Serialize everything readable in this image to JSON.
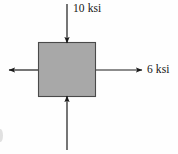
{
  "figure": {
    "kind": "stress-element-diagram",
    "background_color": "#fefefe",
    "element": {
      "name": "stress-element-square",
      "shape": "square",
      "fill_color": "#a8a8a8",
      "stroke_color": "#4a4a4a",
      "x": 38,
      "y": 42,
      "width": 58,
      "height": 55
    },
    "labels": {
      "top": "10 ksi",
      "right": "6 ksi"
    },
    "arrows": [
      {
        "name": "top-compression-arrow",
        "label": "10 ksi",
        "direction": "down",
        "sense": "compression",
        "x1": 67,
        "y1": 4,
        "x2": 67,
        "y2": 43,
        "color": "#1a1a1a"
      },
      {
        "name": "bottom-compression-arrow",
        "label": "10 ksi",
        "direction": "up",
        "sense": "compression",
        "x1": 67,
        "y1": 150,
        "x2": 67,
        "y2": 96,
        "color": "#1a1a1a"
      },
      {
        "name": "right-tension-arrow",
        "label": "6 ksi",
        "direction": "right",
        "sense": "tension",
        "x1": 96,
        "y1": 70,
        "x2": 142,
        "y2": 70,
        "color": "#1a1a1a"
      },
      {
        "name": "left-tension-arrow",
        "label": "6 ksi",
        "direction": "left",
        "sense": "tension",
        "x1": 38,
        "y1": 70,
        "x2": 9,
        "y2": 70,
        "color": "#1a1a1a"
      }
    ],
    "artifact": {
      "name": "page-edge-artifact",
      "description": "partial clipped glyph at left page margin"
    }
  }
}
